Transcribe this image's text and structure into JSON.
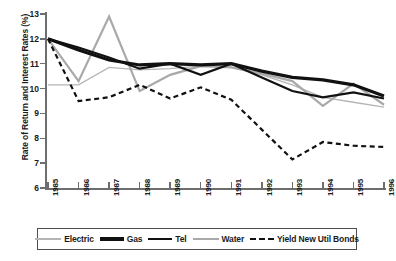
{
  "chart_data": {
    "type": "line",
    "title": "",
    "xlabel": "",
    "ylabel": "Rate of Return and Interest Rates (%)",
    "categories": [
      "1985",
      "1986",
      "1987",
      "1988",
      "1989",
      "1990",
      "1991",
      "1992",
      "1993",
      "1994",
      "1995",
      "1996"
    ],
    "x": [
      1985,
      1986,
      1987,
      1988,
      1989,
      1990,
      1991,
      1992,
      1993,
      1994,
      1995,
      1996
    ],
    "xlim": [
      1985,
      1996
    ],
    "ylim": [
      6,
      13
    ],
    "yticks": [
      6,
      7,
      8,
      9,
      10,
      11,
      12,
      13
    ],
    "grid": false,
    "legend_position": "bottom",
    "series": [
      {
        "name": "Electric",
        "color": "#b5b5b5",
        "style": "solid-thin",
        "values": [
          10.15,
          10.15,
          10.85,
          10.75,
          10.8,
          10.9,
          10.85,
          10.55,
          10.15,
          9.65,
          9.45,
          9.25
        ]
      },
      {
        "name": "Gas",
        "color": "#111111",
        "style": "solid-thick",
        "values": [
          12.0,
          11.55,
          11.15,
          10.95,
          11.0,
          10.95,
          11.0,
          10.7,
          10.45,
          10.35,
          10.15,
          9.7
        ]
      },
      {
        "name": "Tel",
        "color": "#111111",
        "style": "solid-medium",
        "values": [
          12.0,
          11.65,
          11.25,
          10.8,
          11.0,
          10.55,
          11.0,
          10.45,
          9.9,
          9.65,
          9.85,
          9.6
        ]
      },
      {
        "name": "Water",
        "color": "#a9a9a9",
        "style": "solid-medium",
        "values": [
          12.0,
          10.3,
          12.9,
          9.9,
          10.55,
          10.9,
          10.85,
          10.6,
          10.3,
          9.3,
          10.2,
          9.35
        ]
      },
      {
        "name": "Yield New Util Bonds",
        "color": "#111111",
        "style": "dashed",
        "values": [
          12.0,
          9.5,
          9.65,
          10.15,
          9.6,
          10.05,
          9.55,
          8.35,
          7.15,
          7.85,
          7.7,
          7.65
        ]
      }
    ]
  },
  "legend": {
    "entries": [
      {
        "label": "Electric"
      },
      {
        "label": "Gas"
      },
      {
        "label": "Tel"
      },
      {
        "label": "Water"
      },
      {
        "label": "Yield New Util Bonds"
      }
    ]
  }
}
